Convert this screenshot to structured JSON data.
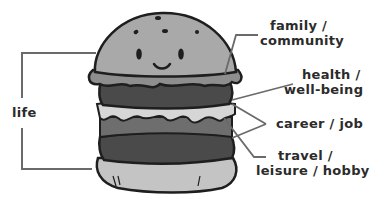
{
  "diagram": {
    "type": "labeled-illustration",
    "bracket_label": "life",
    "layers": [
      {
        "part": "top-bun",
        "label_line1": "family /",
        "label_line2": "community"
      },
      {
        "part": "top-patty",
        "label_line1": "health /",
        "label_line2": "well-being"
      },
      {
        "part": "cheese-and-lower-patty",
        "label_line1": "career / job",
        "label_line2": ""
      },
      {
        "part": "bottom-patty",
        "label_line1": "travel /",
        "label_line2": "leisure / hobby"
      }
    ],
    "colors": {
      "outline": "#1e1e1e",
      "bun": "#a9a9a9",
      "lettuce": "#8e8e8e",
      "patty": "#4a4a4a",
      "cheese": "#d6d6d6",
      "middle": "#6e6e6e",
      "bottom_bun": "#c4c4c4",
      "leader_line": "#6a6a6a",
      "text": "#2b2b2b"
    }
  }
}
